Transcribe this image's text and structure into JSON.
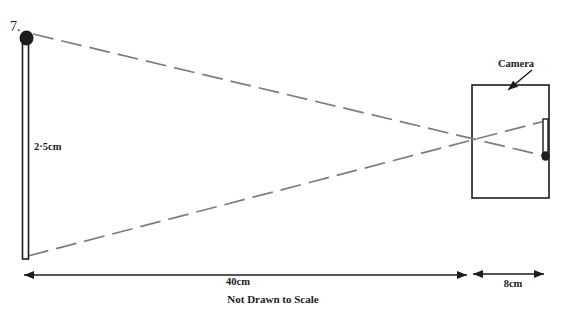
{
  "figure": {
    "question_number": "7.",
    "object_height_label": "2·5cm",
    "camera_label": "Camera",
    "object_distance_label": "40cm",
    "image_distance_label": "8cm",
    "scale_note": "Not Drawn to Scale"
  },
  "diagram_semantics": {
    "object": "matchstick with black head at top, height 2.5cm",
    "image": "inverted matchstick image on camera film, head at bottom",
    "rays": "two gray dashed light rays crossing at pinhole on camera front face",
    "object_distance": "40cm from object to pinhole",
    "image_distance": "8cm from pinhole to film"
  },
  "colors": {
    "background": "#ffffff",
    "ink": "#1c1c1c",
    "ray_gray": "#7d7d7d"
  }
}
